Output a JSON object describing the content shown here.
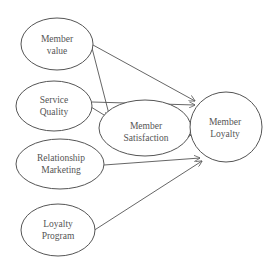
{
  "diagram": {
    "type": "conceptual-model",
    "colors": {
      "stroke": "#555555",
      "text": "#555555",
      "background": "#ffffff"
    },
    "nodes": {
      "member_value": {
        "line1": "Member",
        "line2": "value"
      },
      "service_quality": {
        "line1": "Service",
        "line2": "Quality"
      },
      "relationship_marketing": {
        "line1": "Relationship",
        "line2": "Marketing"
      },
      "loyalty_program": {
        "line1": "Loyalty",
        "line2": "Program"
      },
      "member_satisfaction": {
        "line1": "Member",
        "line2": "Satisfaction"
      },
      "member_loyalty": {
        "line1": "Member",
        "line2": "Loyalty"
      }
    },
    "edges": [
      {
        "from": "Member value",
        "to": "Member Loyalty"
      },
      {
        "from": "Member value",
        "to": "Member Satisfaction"
      },
      {
        "from": "Service Quality",
        "to": "Member Loyalty"
      },
      {
        "from": "Service Quality",
        "to": "Member Satisfaction"
      },
      {
        "from": "Member Satisfaction",
        "to": "Member Loyalty"
      },
      {
        "from": "Relationship Marketing",
        "to": "Member Loyalty"
      },
      {
        "from": "Loyalty Program",
        "to": "Member Loyalty"
      }
    ]
  }
}
